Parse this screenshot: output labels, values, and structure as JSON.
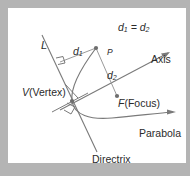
{
  "figure": {
    "background_color": "#b4b4b4",
    "panel_color": "#ffffff",
    "stroke_color": "#7a7a7a",
    "text_color": "#2b2b2b"
  },
  "labels": {
    "equality": "d",
    "equality_sub1": "1",
    "equality_eq": " = d",
    "equality_sub2": "2",
    "line_l": "L",
    "d1": "d",
    "d1_sub": "1",
    "d2": "d",
    "d2_sub": "2",
    "point_p": "P",
    "axis": "Axis",
    "vertex_var": "V",
    "vertex_name": "(Vertex)",
    "focus_var": "F",
    "focus_name": "(Focus)",
    "parabola": "Parabola",
    "directrix": "Directrix"
  },
  "diagram_data": {
    "type": "geometry-diagram",
    "elements": [
      {
        "name": "directrix-line",
        "kind": "line",
        "from": [
          42,
          35
        ],
        "to": [
          97,
          152
        ]
      },
      {
        "name": "axis-line",
        "kind": "line-with-arrow",
        "from": [
          60,
          110
        ],
        "to": [
          170,
          52
        ]
      },
      {
        "name": "parabola-curve",
        "kind": "curve-with-arrow",
        "vertex": [
          72,
          101
        ],
        "through": [
          96,
          48
        ],
        "end": [
          175,
          112
        ]
      },
      {
        "name": "segment-d1",
        "kind": "segment",
        "from": [
          60,
          62
        ],
        "to": [
          96,
          48
        ]
      },
      {
        "name": "segment-d2",
        "kind": "segment",
        "from": [
          96,
          48
        ],
        "to": [
          117,
          96
        ]
      },
      {
        "name": "right-angle-d1",
        "kind": "right-angle-mark",
        "at": [
          60,
          62
        ]
      },
      {
        "name": "right-angle-vertex",
        "kind": "right-angle-mark",
        "at": [
          72,
          101
        ]
      },
      {
        "name": "tangent-tick",
        "kind": "short-segment",
        "from": [
          52,
          110
        ],
        "to": [
          86,
          92
        ]
      },
      {
        "name": "point-P",
        "kind": "dot",
        "at": [
          96,
          48
        ]
      },
      {
        "name": "point-F",
        "kind": "dot",
        "at": [
          117,
          96
        ]
      },
      {
        "name": "point-V",
        "kind": "dot",
        "at": [
          72,
          101
        ]
      },
      {
        "name": "vertex-leader",
        "kind": "leader-line",
        "from": [
          63,
          83
        ],
        "to": [
          78,
          98
        ]
      },
      {
        "name": "axis-arrowhead",
        "kind": "arrowhead",
        "at": [
          170,
          52
        ]
      },
      {
        "name": "parabola-arrowhead",
        "kind": "arrowhead",
        "at": [
          175,
          112
        ]
      }
    ]
  }
}
